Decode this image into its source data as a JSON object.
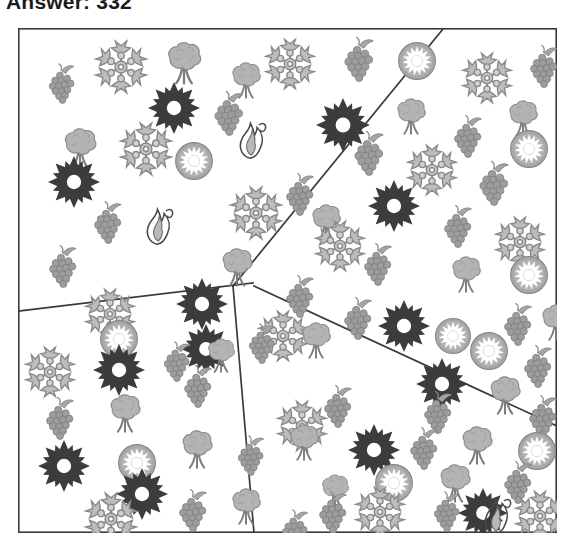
{
  "title": "Answer: 332",
  "figure": {
    "name": "partitioned-icon-field",
    "frame": {
      "x": 0,
      "y": 0,
      "width": 539,
      "height": 505,
      "stroke": "#3a3a3a",
      "fill": "#ffffff"
    },
    "dividers": [
      {
        "name": "divider-top-right",
        "x1": 425,
        "y1": 1,
        "x2": 215,
        "y2": 258
      },
      {
        "name": "divider-middle-vertical",
        "x1": 215,
        "y1": 258,
        "x2": 236,
        "y2": 505
      },
      {
        "name": "divider-left",
        "x1": 235,
        "y1": 255,
        "x2": 1,
        "y2": 283
      },
      {
        "name": "divider-lower-right",
        "x1": 236,
        "y1": 258,
        "x2": 539,
        "y2": 398
      }
    ],
    "regions": [
      {
        "name": "region-top-left",
        "label": ""
      },
      {
        "name": "region-top-right",
        "label": ""
      },
      {
        "name": "region-bottom-left",
        "label": ""
      },
      {
        "name": "region-bottom-right",
        "label": ""
      }
    ],
    "icon_legend": [
      {
        "key": "snowflake",
        "name": "snowflake-icon",
        "color": "#8a8a8a"
      },
      {
        "key": "tree",
        "name": "tree-icon",
        "color": "#a9a9a9"
      },
      {
        "key": "grapes",
        "name": "grapes-icon",
        "color": "#8f8f8f"
      },
      {
        "key": "flower",
        "name": "dark-flower-icon",
        "color": "#3c3c3c"
      },
      {
        "key": "kiwi",
        "name": "sun-circle-icon",
        "color": "#9a9a9a"
      },
      {
        "key": "flame",
        "name": "flame-outline-icon",
        "color": "#4a4a4a"
      }
    ],
    "icons": [
      {
        "t": "grapes",
        "x": 25,
        "y": 40,
        "s": 36,
        "r": -6
      },
      {
        "t": "snowflake",
        "x": 80,
        "y": 16,
        "s": 46,
        "r": 0
      },
      {
        "t": "tree",
        "x": 145,
        "y": 16,
        "s": 42,
        "r": 0
      },
      {
        "t": "tree",
        "x": 210,
        "y": 36,
        "s": 36,
        "r": 0
      },
      {
        "t": "snowflake",
        "x": 250,
        "y": 14,
        "s": 44,
        "r": 0
      },
      {
        "t": "grapes",
        "x": 320,
        "y": 14,
        "s": 40,
        "r": -4
      },
      {
        "t": "kiwi",
        "x": 378,
        "y": 12,
        "s": 42,
        "r": 0
      },
      {
        "t": "snowflake",
        "x": 447,
        "y": 28,
        "s": 44,
        "r": 0
      },
      {
        "t": "grapes",
        "x": 506,
        "y": 22,
        "s": 38,
        "r": -4
      },
      {
        "t": "flower",
        "x": 130,
        "y": 54,
        "s": 52,
        "r": 0
      },
      {
        "t": "grapes",
        "x": 190,
        "y": 68,
        "s": 40,
        "r": -5
      },
      {
        "t": "flower",
        "x": 298,
        "y": 70,
        "s": 54,
        "r": 0
      },
      {
        "t": "tree",
        "x": 375,
        "y": 72,
        "s": 36,
        "r": 0
      },
      {
        "t": "grapes",
        "x": 430,
        "y": 92,
        "s": 38,
        "r": -4
      },
      {
        "t": "tree",
        "x": 487,
        "y": 74,
        "s": 36,
        "r": 0
      },
      {
        "t": "tree",
        "x": 42,
        "y": 102,
        "s": 40,
        "r": 0
      },
      {
        "t": "snowflake",
        "x": 105,
        "y": 98,
        "s": 46,
        "r": 0
      },
      {
        "t": "flame",
        "x": 215,
        "y": 92,
        "s": 40,
        "r": 0
      },
      {
        "t": "kiwi",
        "x": 155,
        "y": 112,
        "s": 42,
        "r": 0
      },
      {
        "t": "grapes",
        "x": 330,
        "y": 108,
        "s": 40,
        "r": -4
      },
      {
        "t": "snowflake",
        "x": 392,
        "y": 120,
        "s": 44,
        "r": 0
      },
      {
        "t": "kiwi",
        "x": 490,
        "y": 100,
        "s": 42,
        "r": 0
      },
      {
        "t": "flower",
        "x": 30,
        "y": 128,
        "s": 52,
        "r": 0
      },
      {
        "t": "grapes",
        "x": 262,
        "y": 150,
        "s": 38,
        "r": -4
      },
      {
        "t": "grapes",
        "x": 455,
        "y": 138,
        "s": 40,
        "r": -4
      },
      {
        "t": "snowflake",
        "x": 215,
        "y": 162,
        "s": 46,
        "r": 0
      },
      {
        "t": "flower",
        "x": 350,
        "y": 152,
        "s": 52,
        "r": 0
      },
      {
        "t": "grapes",
        "x": 70,
        "y": 178,
        "s": 38,
        "r": -5
      },
      {
        "t": "flame",
        "x": 122,
        "y": 178,
        "s": 40,
        "r": 0
      },
      {
        "t": "tree",
        "x": 290,
        "y": 178,
        "s": 36,
        "r": 0
      },
      {
        "t": "snowflake",
        "x": 300,
        "y": 196,
        "s": 44,
        "r": 0
      },
      {
        "t": "grapes",
        "x": 420,
        "y": 182,
        "s": 38,
        "r": -4
      },
      {
        "t": "snowflake",
        "x": 480,
        "y": 192,
        "s": 44,
        "r": 0
      },
      {
        "t": "grapes",
        "x": 25,
        "y": 222,
        "s": 38,
        "r": -5
      },
      {
        "t": "tree",
        "x": 200,
        "y": 222,
        "s": 38,
        "r": 0
      },
      {
        "t": "grapes",
        "x": 340,
        "y": 220,
        "s": 38,
        "r": -4
      },
      {
        "t": "tree",
        "x": 430,
        "y": 230,
        "s": 36,
        "r": 0
      },
      {
        "t": "kiwi",
        "x": 490,
        "y": 226,
        "s": 42,
        "r": 0
      },
      {
        "t": "flower",
        "x": 158,
        "y": 250,
        "s": 52,
        "r": 0
      },
      {
        "t": "snowflake",
        "x": 70,
        "y": 264,
        "s": 44,
        "r": 0
      },
      {
        "t": "grapes",
        "x": 262,
        "y": 252,
        "s": 38,
        "r": -4
      },
      {
        "t": "kiwi",
        "x": 80,
        "y": 290,
        "s": 42,
        "r": 0
      },
      {
        "t": "snowflake",
        "x": 243,
        "y": 286,
        "s": 44,
        "r": 0
      },
      {
        "t": "grapes",
        "x": 320,
        "y": 274,
        "s": 38,
        "r": -4
      },
      {
        "t": "flower",
        "x": 360,
        "y": 272,
        "s": 52,
        "r": 0
      },
      {
        "t": "kiwi",
        "x": 415,
        "y": 288,
        "s": 40,
        "r": 0
      },
      {
        "t": "grapes",
        "x": 480,
        "y": 280,
        "s": 38,
        "r": -4
      },
      {
        "t": "tree",
        "x": 520,
        "y": 278,
        "s": 36,
        "r": 0
      },
      {
        "t": "flower",
        "x": 163,
        "y": 296,
        "s": 50,
        "r": 0
      },
      {
        "t": "grapes",
        "x": 225,
        "y": 300,
        "s": 36,
        "r": -4
      },
      {
        "t": "tree",
        "x": 280,
        "y": 296,
        "s": 36,
        "r": 0
      },
      {
        "t": "kiwi",
        "x": 450,
        "y": 302,
        "s": 42,
        "r": 0
      },
      {
        "t": "snowflake",
        "x": 10,
        "y": 322,
        "s": 44,
        "r": 0
      },
      {
        "t": "flower",
        "x": 75,
        "y": 316,
        "s": 52,
        "r": 0
      },
      {
        "t": "grapes",
        "x": 140,
        "y": 318,
        "s": 36,
        "r": -4
      },
      {
        "t": "tree",
        "x": 186,
        "y": 312,
        "s": 34,
        "r": 0
      },
      {
        "t": "grapes",
        "x": 160,
        "y": 342,
        "s": 38,
        "r": -4
      },
      {
        "t": "flower",
        "x": 398,
        "y": 330,
        "s": 52,
        "r": 0
      },
      {
        "t": "grapes",
        "x": 500,
        "y": 322,
        "s": 38,
        "r": -4
      },
      {
        "t": "grapes",
        "x": 22,
        "y": 374,
        "s": 38,
        "r": -4
      },
      {
        "t": "tree",
        "x": 88,
        "y": 368,
        "s": 38,
        "r": 0
      },
      {
        "t": "grapes",
        "x": 300,
        "y": 362,
        "s": 38,
        "r": -4
      },
      {
        "t": "snowflake",
        "x": 262,
        "y": 376,
        "s": 44,
        "r": 0
      },
      {
        "t": "tree",
        "x": 468,
        "y": 350,
        "s": 38,
        "r": 0
      },
      {
        "t": "grapes",
        "x": 400,
        "y": 368,
        "s": 38,
        "r": -4
      },
      {
        "t": "grapes",
        "x": 505,
        "y": 372,
        "s": 38,
        "r": -4
      },
      {
        "t": "flower",
        "x": 20,
        "y": 412,
        "s": 52,
        "r": 0
      },
      {
        "t": "kiwi",
        "x": 98,
        "y": 414,
        "s": 42,
        "r": 0
      },
      {
        "t": "tree",
        "x": 160,
        "y": 404,
        "s": 38,
        "r": 0
      },
      {
        "t": "grapes",
        "x": 214,
        "y": 412,
        "s": 36,
        "r": -4
      },
      {
        "t": "tree",
        "x": 268,
        "y": 398,
        "s": 36,
        "r": 0
      },
      {
        "t": "flower",
        "x": 330,
        "y": 396,
        "s": 52,
        "r": 0
      },
      {
        "t": "grapes",
        "x": 386,
        "y": 404,
        "s": 38,
        "r": -4
      },
      {
        "t": "tree",
        "x": 440,
        "y": 400,
        "s": 38,
        "r": 0
      },
      {
        "t": "kiwi",
        "x": 498,
        "y": 402,
        "s": 42,
        "r": 0
      },
      {
        "t": "flower",
        "x": 98,
        "y": 440,
        "s": 52,
        "r": 0
      },
      {
        "t": "kiwi",
        "x": 355,
        "y": 434,
        "s": 42,
        "r": 0
      },
      {
        "t": "tree",
        "x": 300,
        "y": 448,
        "s": 34,
        "r": 0
      },
      {
        "t": "tree",
        "x": 418,
        "y": 438,
        "s": 38,
        "r": 0
      },
      {
        "t": "grapes",
        "x": 480,
        "y": 438,
        "s": 38,
        "r": -4
      },
      {
        "t": "flower",
        "x": 440,
        "y": 460,
        "s": 50,
        "r": 0
      },
      {
        "t": "kiwi",
        "x": 380,
        "y": 460,
        "s": 0,
        "r": 0
      },
      {
        "t": "grapes",
        "x": 155,
        "y": 466,
        "s": 38,
        "r": -4
      },
      {
        "t": "tree",
        "x": 210,
        "y": 462,
        "s": 36,
        "r": 0
      },
      {
        "t": "snowflake",
        "x": 70,
        "y": 468,
        "s": 46,
        "r": 0
      },
      {
        "t": "grapes",
        "x": 295,
        "y": 468,
        "s": 38,
        "r": -4
      },
      {
        "t": "snowflake",
        "x": 340,
        "y": 462,
        "s": 44,
        "r": 0
      },
      {
        "t": "grapes",
        "x": 258,
        "y": 486,
        "s": 36,
        "r": -4
      },
      {
        "t": "grapes",
        "x": 410,
        "y": 468,
        "s": 36,
        "r": -4
      },
      {
        "t": "flame",
        "x": 460,
        "y": 468,
        "s": 40,
        "r": 0
      },
      {
        "t": "tree",
        "x": 300,
        "y": 478,
        "s": 0,
        "r": 0
      },
      {
        "t": "flame",
        "x": 320,
        "y": 470,
        "s": 0,
        "r": 0
      },
      {
        "t": "snowflake",
        "x": 500,
        "y": 466,
        "s": 44,
        "r": 0
      }
    ]
  }
}
